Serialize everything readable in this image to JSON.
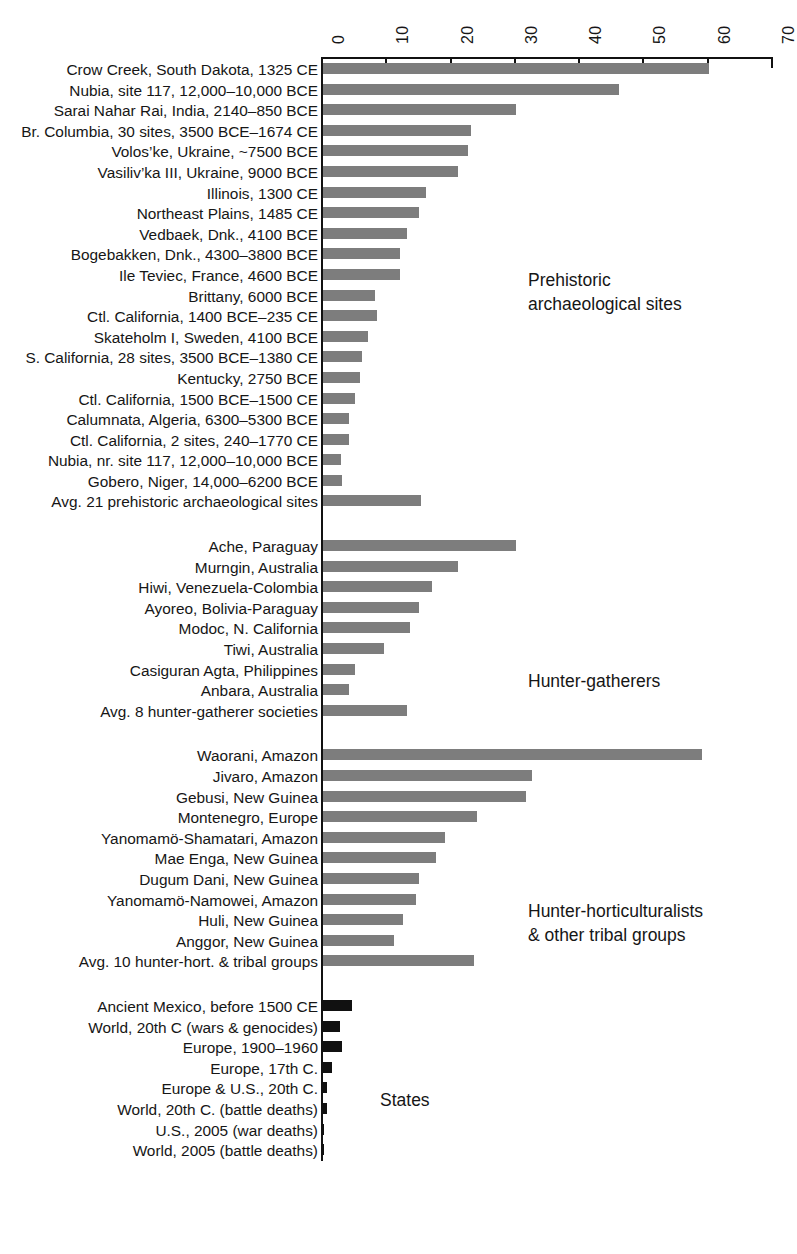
{
  "chart_data": {
    "type": "bar",
    "orientation": "horizontal",
    "title": "",
    "subtitle": "",
    "xlabel": "",
    "ylabel": "",
    "xlim": [
      0,
      70
    ],
    "xticks": [
      0,
      10,
      20,
      30,
      40,
      50,
      60,
      70
    ],
    "xtick_labels": [
      "0",
      "10",
      "20",
      "30",
      "40",
      "50",
      "60",
      "70"
    ],
    "grid": false,
    "legend": "none",
    "bar_color": "#7d7d7d",
    "state_bar_color": "#111111",
    "groups": [
      {
        "name": "Prehistoric archaeological sites",
        "annotation": "Prehistoric\narchaeological sites",
        "color": "#7d7d7d",
        "categories": [
          "Crow Creek, South Dakota, 1325 CE",
          "Nubia, site 117, 12,000–10,000 BCE",
          "Sarai Nahar Rai, India, 2140–850 BCE",
          "Br. Columbia, 30 sites, 3500 BCE–1674 CE",
          "Volos’ke, Ukraine, ~7500 BCE",
          "Vasiliv’ka III, Ukraine, 9000 BCE",
          "Illinois, 1300 CE",
          "Northeast Plains, 1485 CE",
          "Vedbaek, Dnk., 4100 BCE",
          "Bogebakken, Dnk., 4300–3800 BCE",
          "Ile Teviec, France, 4600 BCE",
          "Brittany, 6000 BCE",
          "Ctl. California, 1400 BCE–235 CE",
          "Skateholm I, Sweden, 4100 BCE",
          "S. California, 28 sites, 3500 BCE–1380 CE",
          "Kentucky, 2750 BCE",
          "Ctl. California, 1500 BCE–1500 CE",
          "Calumnata, Algeria, 6300–5300 BCE",
          "Ctl. California, 2 sites, 240–1770 CE",
          "Nubia, nr. site 117, 12,000–10,000 BCE",
          "Gobero, Niger, 14,000–6200 BCE",
          "Avg. 21 prehistoric archaeological sites"
        ],
        "values": [
          60,
          46,
          30,
          23,
          22.5,
          21,
          16,
          15,
          13,
          12,
          12,
          8.1,
          8.4,
          7,
          6.1,
          5.8,
          5,
          4,
          4,
          2.8,
          2.9,
          15.2
        ]
      },
      {
        "name": "Hunter-gatherers",
        "annotation": "Hunter-gatherers",
        "color": "#7d7d7d",
        "categories": [
          "Ache, Paraguay",
          "Murngin, Australia",
          "Hiwi, Venezuela-Colombia",
          "Ayoreo, Bolivia-Paraguay",
          "Modoc, N. California",
          "Tiwi, Australia",
          "Casiguran Agta, Philippines",
          "Anbara, Australia",
          "Avg. 8 hunter-gatherer societies"
        ],
        "values": [
          30,
          21,
          17,
          15,
          13.5,
          9.5,
          5,
          4,
          13
        ]
      },
      {
        "name": "Hunter-horticulturalists & other tribal groups",
        "annotation": "Hunter-horticulturalists\n& other tribal groups",
        "color": "#7d7d7d",
        "categories": [
          "Waorani, Amazon",
          "Jivaro, Amazon",
          "Gebusi, New Guinea",
          "Montenegro, Europe",
          "Yanomamö-Shamatari, Amazon",
          "Mae Enga, New Guinea",
          "Dugum Dani, New Guinea",
          "Yanomamö-Namowei, Amazon",
          "Huli, New Guinea",
          "Anggor, New Guinea",
          "Avg. 10 hunter-hort. & tribal groups"
        ],
        "values": [
          59,
          32.5,
          31.5,
          24,
          19,
          17.5,
          15,
          14.5,
          12.5,
          11,
          23.5
        ]
      },
      {
        "name": "States",
        "annotation": "States",
        "color": "#111111",
        "categories": [
          "Ancient Mexico, before 1500 CE",
          "World, 20th C (wars & genocides)",
          "Europe, 1900–1960",
          "Europe, 17th C.",
          "Europe & U.S., 20th C.",
          "World, 20th C. (battle deaths)",
          "U.S., 2005 (war deaths)",
          "World, 2005 (battle deaths)"
        ],
        "values": [
          4.5,
          2.6,
          3.0,
          1.4,
          0.6,
          0.6,
          0.02,
          0.02
        ]
      }
    ]
  },
  "axis": {
    "ticks": [
      "0",
      "10",
      "20",
      "30",
      "40",
      "50",
      "60",
      "70"
    ]
  },
  "annotations": {
    "prehistoric": "Prehistoric\narchaeological sites",
    "hunter_gatherers": "Hunter-gatherers",
    "hunter_horticulturalists": "Hunter-horticulturalists\n& other tribal groups",
    "states": "States"
  }
}
